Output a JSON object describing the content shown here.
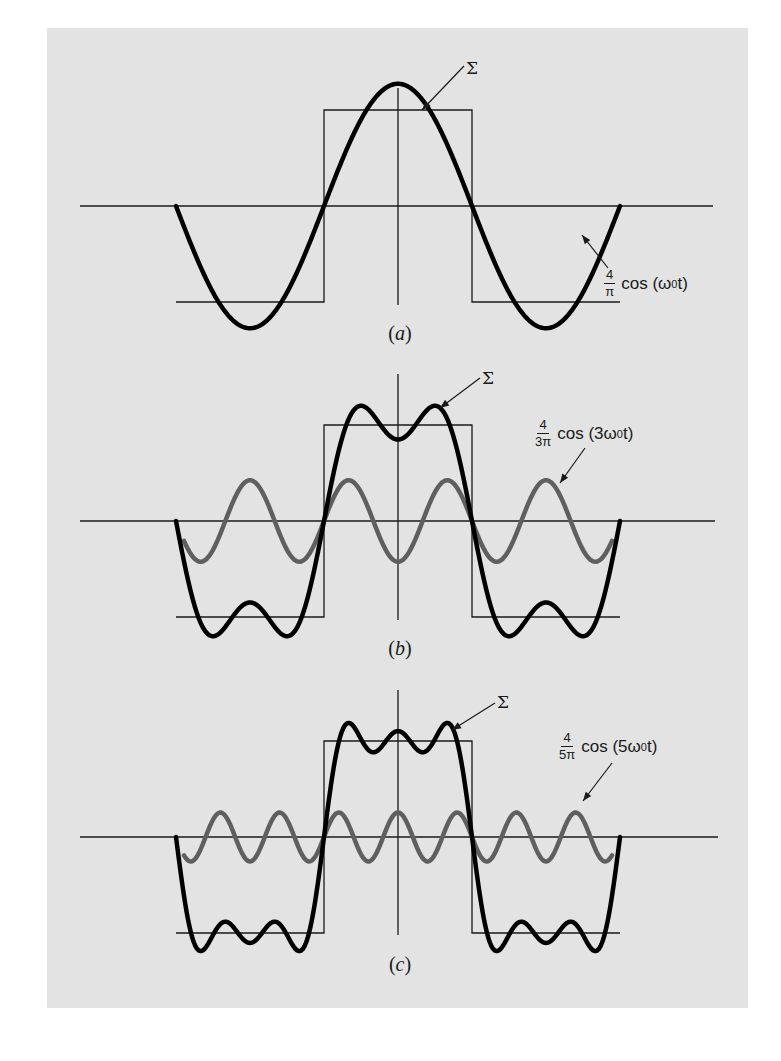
{
  "figure": {
    "background": "#e3e3e3",
    "sum_color": "#000000",
    "harmonic_color": "#5f5f5f",
    "panels": [
      {
        "id": "a",
        "caption": "a",
        "sum_label": "Σ",
        "term": {
          "num": "4",
          "den": "π",
          "func": "cos (ω",
          "sub": "0",
          "tail": "t)"
        }
      },
      {
        "id": "b",
        "caption": "b",
        "sum_label": "Σ",
        "term": {
          "num": "4",
          "den": "3π",
          "func": "cos (3ω",
          "sub": "0",
          "tail": "t)"
        }
      },
      {
        "id": "c",
        "caption": "c",
        "sum_label": "Σ",
        "term": {
          "num": "4",
          "den": "5π",
          "func": "cos (5ω",
          "sub": "0",
          "tail": "t)"
        }
      }
    ]
  },
  "chart_data": {
    "type": "line",
    "xlabel": "t",
    "ylabel": "f(t)",
    "x_range_periods": [
      -1,
      1
    ],
    "square_wave": {
      "high": 1,
      "low": -1,
      "half_width_periods": 0.25
    },
    "panels": [
      {
        "caption": "(a)",
        "harmonics": [
          1
        ],
        "series": [
          {
            "name": "Σ = (4/π) cos(ω0 t)",
            "style": "black-thick"
          },
          {
            "name": "square wave",
            "style": "thin"
          }
        ]
      },
      {
        "caption": "(b)",
        "harmonics": [
          1,
          3
        ],
        "series": [
          {
            "name": "Σ",
            "style": "black-thick"
          },
          {
            "name": "(4/3π) cos(3ω0 t)",
            "style": "gray-thick"
          },
          {
            "name": "square wave",
            "style": "thin"
          }
        ]
      },
      {
        "caption": "(c)",
        "harmonics": [
          1,
          3,
          5
        ],
        "series": [
          {
            "name": "Σ",
            "style": "black-thick"
          },
          {
            "name": "(4/5π) cos(5ω0 t)",
            "style": "gray-thick"
          },
          {
            "name": "square wave",
            "style": "thin"
          }
        ]
      }
    ]
  }
}
